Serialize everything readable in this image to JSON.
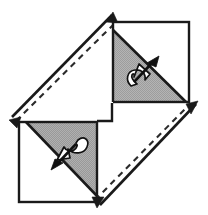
{
  "figure": {
    "kind": "geometry-diagram",
    "width": 208,
    "height": 215,
    "background_color": "#ffffff",
    "stroke_color": "#1a1a1a",
    "shade_color": "#b0b0b0",
    "shade_color_alt": "#a8a8a8",
    "arrow_fill_color": "#ffffff",
    "arrow_outline_color": "#111111",
    "dash_color": "#2b2b2b"
  },
  "squares": [
    {
      "name": "upper-right-square",
      "label": "",
      "x": 113,
      "y": 22,
      "width": 76,
      "height": 80,
      "points": "113,22 189,22 189,102 113,102",
      "shaded_triangle_points": "113,30 113,102 185,102",
      "diagonal": "113,30 186,102",
      "shaded_half": "lower-left"
    },
    {
      "name": "lower-left-square",
      "label": "",
      "x": 19,
      "y": 122,
      "width": 78,
      "height": 80,
      "points": "19,122 97,122 97,202 19,202",
      "shaded_triangle_points": "26,122 97,122 97,195",
      "diagonal": "26,122 97,196",
      "shaded_half": "upper-right"
    }
  ],
  "axes": [
    {
      "name": "upper-left-symmetry-axis",
      "label": "",
      "from_x": 10,
      "from_y": 119,
      "to_x": 114,
      "to_y": 13,
      "double_headed": true,
      "dashed_partner": {
        "from_x": 16,
        "from_y": 121,
        "to_x": 116,
        "to_y": 22
      }
    },
    {
      "name": "lower-right-symmetry-axis",
      "label": "",
      "from_x": 98,
      "from_y": 206,
      "to_x": 197,
      "to_y": 102,
      "double_headed": true,
      "dashed_partner": {
        "from_x": 95,
        "from_y": 200,
        "to_x": 190,
        "to_y": 104
      }
    }
  ],
  "rotation_arrows": [
    {
      "name": "upper-rotation-arrow",
      "label": "",
      "direction": "up-right",
      "center_x": 143,
      "center_y": 73,
      "tip_x": 158,
      "tip_y": 58
    },
    {
      "name": "lower-rotation-arrow",
      "label": "",
      "direction": "down-left",
      "center_x": 66,
      "center_y": 151,
      "tip_x": 53,
      "tip_y": 167
    }
  ],
  "accessibility": {
    "alt_text": "Black and white line diagram: two squares positioned diagonally, upper right and lower left, each split by a diagonal into a white half and a gray shaded half; a white curved arrow pierces each square; two long double headed arrows with parallel dashed lines run along the upper left and lower right diagonals."
  }
}
